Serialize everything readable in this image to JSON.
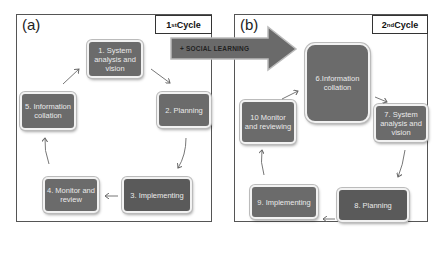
{
  "panels": {
    "a": {
      "label": "(a)",
      "cycle_label": "1",
      "cycle_sup": "st",
      "cycle_word": " Cycle",
      "nodes": [
        "1. System analysis and vision",
        "2. Planning",
        "3. Implementing",
        "4. Monitor and review",
        "5. Information collation"
      ]
    },
    "b": {
      "label": "(b)",
      "cycle_label": "2",
      "cycle_sup": "nd",
      "cycle_word": " Cycle",
      "nodes": [
        "6.Information collation",
        "7. System analysis and vision",
        "8. Planning",
        "9. Implementing",
        "10 Monitor and reviewing"
      ]
    }
  },
  "transition_arrow": {
    "label": "+ SOCIAL LEARNING"
  },
  "colors": {
    "node_fill": "#6b6b6b",
    "node_text": "#eaeaea",
    "border": "#555555"
  }
}
